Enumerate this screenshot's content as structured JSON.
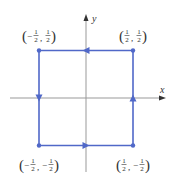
{
  "diagram": {
    "type": "oriented-square-path",
    "axes": {
      "x_label": "x",
      "y_label": "y"
    },
    "colors": {
      "path": "#5068c8",
      "axis": "#999999",
      "text": "#333333",
      "axis_arrow": "#333333"
    },
    "vertices": [
      {
        "id": "top-left",
        "x": -0.5,
        "y": 0.5,
        "label": {
          "x_sign": "−",
          "y_sign": "",
          "num": "1",
          "den": "2"
        }
      },
      {
        "id": "top-right",
        "x": 0.5,
        "y": 0.5,
        "label": {
          "x_sign": "",
          "y_sign": "",
          "num": "1",
          "den": "2"
        }
      },
      {
        "id": "bottom-left",
        "x": -0.5,
        "y": -0.5,
        "label": {
          "x_sign": "−",
          "y_sign": "−",
          "num": "1",
          "den": "2"
        }
      },
      {
        "id": "bottom-right",
        "x": 0.5,
        "y": -0.5,
        "label": {
          "x_sign": "",
          "y_sign": "−",
          "num": "1",
          "den": "2"
        }
      }
    ],
    "edges": [
      {
        "from": "top-right",
        "to": "top-left",
        "direction": "left"
      },
      {
        "from": "top-left",
        "to": "bottom-left",
        "direction": "down"
      },
      {
        "from": "bottom-left",
        "to": "bottom-right",
        "direction": "right"
      },
      {
        "from": "bottom-right",
        "to": "top-right",
        "direction": "up"
      }
    ],
    "text": {
      "open_paren": "(",
      "close_paren": ")",
      "comma": ","
    }
  }
}
